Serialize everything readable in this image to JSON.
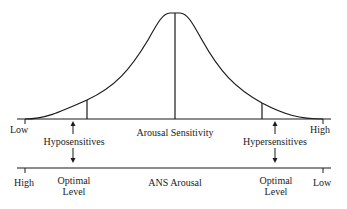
{
  "diagram": {
    "top_axis": {
      "low_label": "Low",
      "high_label": "High",
      "title": "Arousal Sensitivity"
    },
    "left_group": "Hyposensitives",
    "right_group": "Hypersensitives",
    "bottom_axis": {
      "left_label": "High",
      "right_label": "Low",
      "title": "ANS Arousal",
      "left_optimal": "Optimal Level",
      "right_optimal": "Optimal Level",
      "left_optimal_line1": "Optimal",
      "left_optimal_line2": "Level",
      "right_optimal_line1": "Optimal",
      "right_optimal_line2": "Level"
    },
    "curve": "bell-curve",
    "colors": {
      "ink": "#1a1a1a",
      "background": "#ffffff"
    }
  }
}
